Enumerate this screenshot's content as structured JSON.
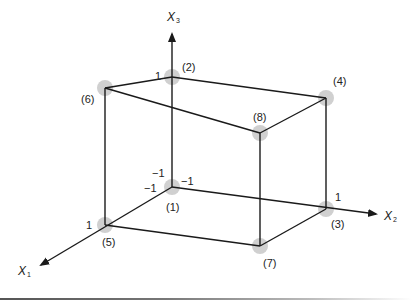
{
  "diagram": {
    "type": "3d-cube-design-points",
    "axes": {
      "x1": {
        "name": "X",
        "sub": "1"
      },
      "x2": {
        "name": "X",
        "sub": "2"
      },
      "x3": {
        "name": "X",
        "sub": "3"
      }
    },
    "tick_labels": {
      "x3_high": "1",
      "x1_high": "1",
      "x2_high": "1",
      "x3_low": "−1",
      "x2_low": "−1",
      "x1_low": "−1"
    },
    "points": [
      {
        "label": "(1)",
        "x": 172,
        "y": 187
      },
      {
        "label": "(2)",
        "x": 172,
        "y": 77
      },
      {
        "label": "(3)",
        "x": 326,
        "y": 209
      },
      {
        "label": "(4)",
        "x": 326,
        "y": 98
      },
      {
        "label": "(5)",
        "x": 105,
        "y": 225
      },
      {
        "label": "(6)",
        "x": 105,
        "y": 88
      },
      {
        "label": "(7)",
        "x": 260,
        "y": 246
      },
      {
        "label": "(8)",
        "x": 260,
        "y": 133
      }
    ],
    "colors": {
      "line": "#1a1a1a",
      "point_halo": "#c8c8c8"
    }
  }
}
